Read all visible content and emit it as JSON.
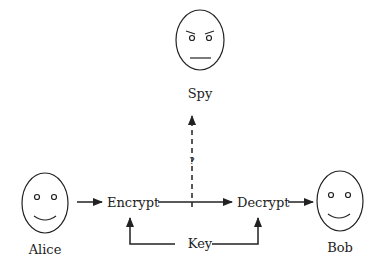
{
  "diagram": {
    "nodes": {
      "spy": {
        "label": "Spy"
      },
      "alice": {
        "label": "Alice"
      },
      "bob": {
        "label": "Bob"
      },
      "encrypt": {
        "label": "Encrypt"
      },
      "decrypt": {
        "label": "Decrypt"
      },
      "key": {
        "label": "Key"
      }
    },
    "edges": [
      {
        "from": "Alice",
        "to": "Encrypt",
        "style": "solid"
      },
      {
        "from": "Encrypt",
        "to": "Decrypt",
        "style": "solid"
      },
      {
        "from": "Decrypt",
        "to": "Bob",
        "style": "solid"
      },
      {
        "from": "Key",
        "to": "Encrypt",
        "style": "solid"
      },
      {
        "from": "Key",
        "to": "Decrypt",
        "style": "solid"
      },
      {
        "from": "Channel",
        "to": "Spy",
        "style": "dashed",
        "label": "?"
      }
    ],
    "intercept_label": "?"
  }
}
